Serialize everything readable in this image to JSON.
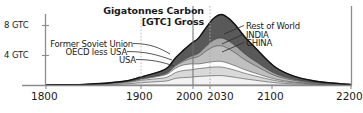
{
  "chart_data": {
    "type": "area",
    "title": "Gigatonnes Carbon [GTC] Gross",
    "title_line1": "Gigatonnes Carbon",
    "title_line2": "[GTC] Gross",
    "xlabel": "",
    "ylabel": "",
    "xlim": [
      1800,
      2200
    ],
    "ylim": [
      0,
      9.6
    ],
    "x_ticks": [
      "1800",
      "1900",
      "2000",
      "2030",
      "2100",
      "2200"
    ],
    "x_tick_values": [
      1800,
      1900,
      2000,
      2030,
      2100,
      2200
    ],
    "y_ticks": [
      "4 GTC",
      "8 GTC"
    ],
    "y_tick_values": [
      4,
      8
    ],
    "grid": "vertical dotted at 1900 and 2030, solid at 2000",
    "legend": "inline annotations with leader lines",
    "stacked": true,
    "x": [
      1800,
      1850,
      1900,
      1925,
      1950,
      1960,
      1970,
      1980,
      1990,
      2000,
      2010,
      2020,
      2030,
      2040,
      2050,
      2060,
      2075,
      2100,
      2125,
      2150,
      2175,
      2200
    ],
    "series": [
      {
        "name": "USA",
        "color": "#f2f2f2",
        "values": [
          0.0,
          0.02,
          0.12,
          0.3,
          0.45,
          0.55,
          0.85,
          0.95,
          1.0,
          1.1,
          1.15,
          1.2,
          1.2,
          1.1,
          0.95,
          0.8,
          0.6,
          0.3,
          0.15,
          0.08,
          0.04,
          0.01
        ]
      },
      {
        "name": "OECD less USA",
        "color": "#d9d9d9",
        "values": [
          0.01,
          0.03,
          0.15,
          0.3,
          0.4,
          0.5,
          0.75,
          0.9,
          0.95,
          1.0,
          1.05,
          1.1,
          1.1,
          1.0,
          0.88,
          0.72,
          0.55,
          0.28,
          0.14,
          0.07,
          0.03,
          0.01
        ]
      },
      {
        "name": "Former Soviet Union",
        "color": "#fbfbfb",
        "values": [
          0.0,
          0.01,
          0.05,
          0.12,
          0.3,
          0.4,
          0.55,
          0.7,
          0.75,
          0.6,
          0.65,
          0.7,
          0.72,
          0.65,
          0.56,
          0.46,
          0.35,
          0.18,
          0.09,
          0.04,
          0.02,
          0.01
        ]
      },
      {
        "name": "CHINA",
        "color": "#bfbfbf",
        "values": [
          0.0,
          0.0,
          0.02,
          0.05,
          0.1,
          0.15,
          0.3,
          0.45,
          0.7,
          0.95,
          1.5,
          1.9,
          2.0,
          1.85,
          1.6,
          1.3,
          0.95,
          0.45,
          0.22,
          0.1,
          0.05,
          0.01
        ]
      },
      {
        "name": "INDIA",
        "color": "#a6a6a6",
        "values": [
          0.0,
          0.0,
          0.01,
          0.02,
          0.04,
          0.06,
          0.1,
          0.18,
          0.28,
          0.4,
          0.6,
          0.85,
          1.0,
          1.0,
          0.9,
          0.76,
          0.56,
          0.28,
          0.13,
          0.06,
          0.03,
          0.01
        ]
      },
      {
        "name": "Rest of World",
        "color": "#595959",
        "values": [
          0.01,
          0.02,
          0.1,
          0.25,
          0.45,
          0.6,
          0.95,
          1.25,
          1.6,
          1.95,
          2.4,
          2.8,
          3.0,
          2.9,
          2.6,
          2.2,
          1.7,
          0.85,
          0.4,
          0.2,
          0.09,
          0.02
        ]
      }
    ],
    "totals": [
      0.02,
      0.08,
      0.45,
      1.04,
      1.74,
      2.26,
      3.5,
      4.43,
      5.28,
      6.0,
      7.35,
      8.55,
      9.02,
      8.5,
      7.49,
      6.24,
      4.71,
      2.34,
      1.13,
      0.55,
      0.26,
      0.07
    ],
    "annotations_left": [
      {
        "label": "Former Soviet Union"
      },
      {
        "label": "OECD less USA"
      },
      {
        "label": "USA"
      }
    ],
    "annotations_right": [
      {
        "label": "Rest of World"
      },
      {
        "label": "INDIA"
      },
      {
        "label": "CHINA"
      }
    ]
  },
  "colors": {
    "axis": "#8c8c8c",
    "outline": "#111111",
    "text": "#1a1a1a",
    "gridline_solid": "#6e6e6e",
    "gridline_dotted": "#b3b3b3"
  }
}
